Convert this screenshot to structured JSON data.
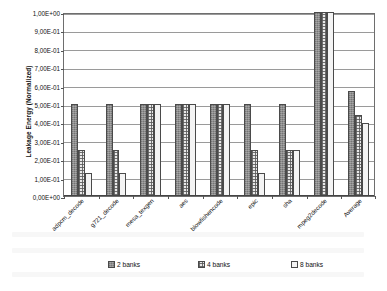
{
  "chart_data": {
    "type": "bar",
    "title": "",
    "subtitle": "",
    "xlabel": "",
    "ylabel": "Leakage Energy (Normalized)",
    "ylim": [
      0,
      1
    ],
    "grid": true,
    "legend_position": "bottom",
    "categories": [
      "adpcm_decode",
      "g721_decode",
      "mesa_texgen",
      "aes",
      "blowfishencode",
      "epic",
      "sha",
      "mpeg2decode",
      "Average"
    ],
    "series": [
      {
        "name": "2 banks",
        "fill": "dark-grey-solid",
        "color": "#8e8e8e",
        "values": [
          0.5,
          0.5,
          0.5,
          0.5,
          0.5,
          0.5,
          0.5,
          1.0,
          0.57
        ]
      },
      {
        "name": "4 banks",
        "fill": "light-dotted",
        "color": "#e9e9e9",
        "values": [
          0.25,
          0.25,
          0.5,
          0.5,
          0.5,
          0.25,
          0.25,
          1.0,
          0.44
        ]
      },
      {
        "name": "8 banks",
        "fill": "white-empty",
        "color": "#f4f4f4",
        "values": [
          0.125,
          0.125,
          0.5,
          0.5,
          0.5,
          0.125,
          0.25,
          1.0,
          0.395
        ]
      }
    ],
    "ytick_labels": [
      "0,00E+00",
      "1,00E-01",
      "2,00E-01",
      "3,00E-01",
      "4,00E-01",
      "5,00E-01",
      "6,00E-01",
      "7,00E-01",
      "8,00E-01",
      "9,00E-01",
      "1,00E+00"
    ],
    "ytick_values": [
      0,
      0.1,
      0.2,
      0.3,
      0.4,
      0.5,
      0.6,
      0.7,
      0.8,
      0.9,
      1.0
    ]
  },
  "legend": {
    "items": [
      {
        "label": "2 banks"
      },
      {
        "label": "4 banks"
      },
      {
        "label": "8 banks"
      }
    ]
  }
}
